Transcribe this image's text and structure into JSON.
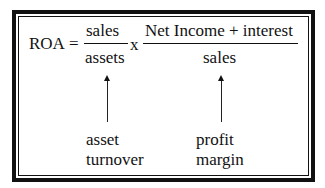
{
  "formula": {
    "lhs": "ROA",
    "equals": "=",
    "fraction1": {
      "numerator": "sales",
      "denominator": "assets"
    },
    "times": "x",
    "fraction2": {
      "numerator": "Net Income + interest",
      "denominator": "sales"
    }
  },
  "annotations": [
    {
      "line1": "asset",
      "line2": "turnover"
    },
    {
      "line1": "profit",
      "line2": "margin"
    }
  ],
  "colors": {
    "ink": "#111111",
    "background": "#ffffff"
  }
}
